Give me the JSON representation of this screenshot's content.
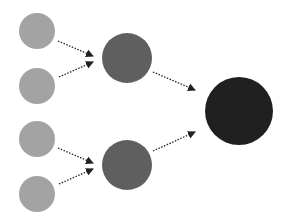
{
  "diagram": {
    "title": "",
    "colors": {
      "background": "#ffffff",
      "input_node": "#a3a3a3",
      "hidden_node": "#5f5f5f",
      "output_node": "#202020",
      "edge": "#222222"
    },
    "nodes": [
      {
        "id": "in1",
        "layer": "input",
        "cx": 37,
        "cy": 31,
        "r": 18
      },
      {
        "id": "in2",
        "layer": "input",
        "cx": 37,
        "cy": 86,
        "r": 18
      },
      {
        "id": "in3",
        "layer": "input",
        "cx": 37,
        "cy": 139,
        "r": 18
      },
      {
        "id": "in4",
        "layer": "input",
        "cx": 37,
        "cy": 194,
        "r": 18
      },
      {
        "id": "h1",
        "layer": "hidden",
        "cx": 127,
        "cy": 58,
        "r": 25
      },
      {
        "id": "h2",
        "layer": "hidden",
        "cx": 127,
        "cy": 165,
        "r": 25
      },
      {
        "id": "out",
        "layer": "output",
        "cx": 239,
        "cy": 111,
        "r": 34
      }
    ],
    "edges": [
      {
        "from": "in1",
        "to": "h1",
        "x1": 58,
        "y1": 41,
        "x2": 93,
        "y2": 56
      },
      {
        "from": "in2",
        "to": "h1",
        "x1": 59,
        "y1": 77,
        "x2": 93,
        "y2": 62
      },
      {
        "from": "in3",
        "to": "h2",
        "x1": 58,
        "y1": 148,
        "x2": 93,
        "y2": 163
      },
      {
        "from": "in4",
        "to": "h2",
        "x1": 59,
        "y1": 184,
        "x2": 93,
        "y2": 169
      },
      {
        "from": "h1",
        "to": "out",
        "x1": 153,
        "y1": 72,
        "x2": 195,
        "y2": 90
      },
      {
        "from": "h2",
        "to": "out",
        "x1": 153,
        "y1": 151,
        "x2": 195,
        "y2": 132
      }
    ]
  }
}
